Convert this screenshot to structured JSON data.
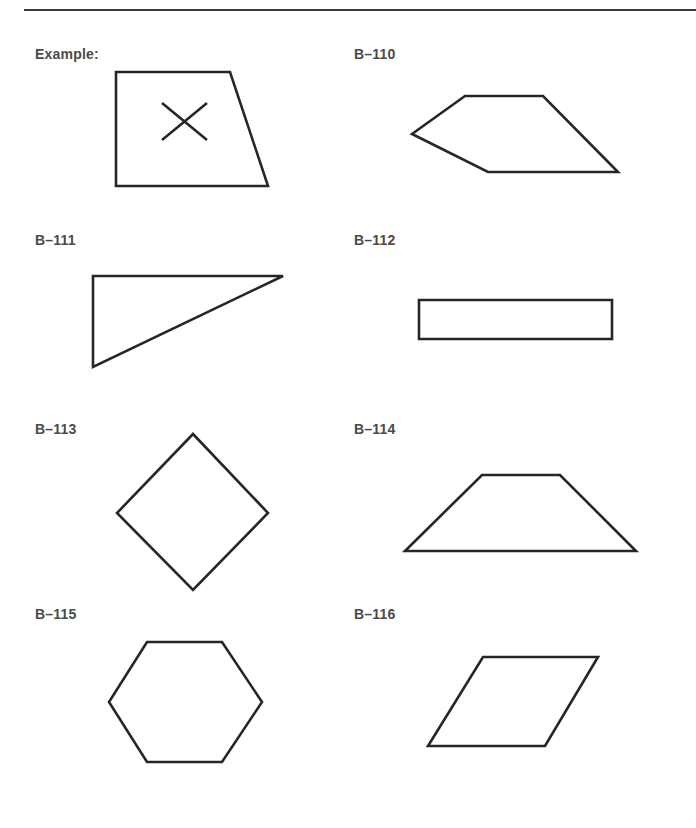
{
  "page": {
    "colors": {
      "text": "#4a4a4a",
      "stroke": "#262626",
      "rule": "#3a3a3a",
      "background": "#ffffff"
    }
  },
  "items": [
    {
      "label": "Example:",
      "shape": "trapezoid-with-x",
      "points": "116,72 230,72 268,186 116,186",
      "mark": "x"
    },
    {
      "label": "B–110",
      "shape": "irregular-pentagon",
      "points": "412,134 465,96 543,96 618,172 488,172"
    },
    {
      "label": "B–111",
      "shape": "right-triangle",
      "points": "93,276 283,276 93,367"
    },
    {
      "label": "B–112",
      "shape": "rectangle",
      "points": "419,300 612,300 612,339 419,339"
    },
    {
      "label": "B–113",
      "shape": "rhombus-diamond",
      "points": "193,434 268,513 193,590 117,513"
    },
    {
      "label": "B–114",
      "shape": "isosceles-trapezoid",
      "points": "482,475 560,475 636,551 405,551"
    },
    {
      "label": "B–115",
      "shape": "hexagon",
      "points": "147,642 222,642 262,702 222,762 147,762 109,702"
    },
    {
      "label": "B–116",
      "shape": "parallelogram",
      "points": "483,657 598,657 545,746 428,746"
    }
  ]
}
